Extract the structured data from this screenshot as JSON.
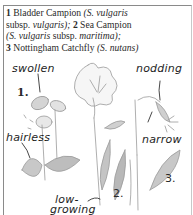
{
  "caption": {
    "items": [
      {
        "number": "1",
        "common": "Bladder Campion",
        "latin_pre": "(S. ",
        "latin": "vulgaris",
        "mid": " subsp. ",
        "latin2": "vulgaris",
        "post": ");"
      },
      {
        "number": "2",
        "common": "Sea Campion",
        "latin_pre": "(S. ",
        "latin": "vulgaris",
        "mid": " subsp. ",
        "latin2": "maritima",
        "post": ");"
      },
      {
        "number": "3",
        "common": "Nottingham Catchfly",
        "latin_pre": "(S. ",
        "latin": "nutans",
        "mid": "",
        "latin2": "",
        "post": ")"
      }
    ]
  },
  "labels": {
    "swollen": "swollen",
    "nodding": "nodding",
    "hairless": "hairless",
    "narrow": "narrow",
    "low": "low-",
    "growing": "growing"
  },
  "numbers": {
    "one": "1.",
    "two": "2.",
    "three": "3."
  },
  "colors": {
    "ink": "#2a2a2a",
    "sketch": "#9a9a9a",
    "shade": "#b5b5b5",
    "frame": "#8a8a8a"
  }
}
